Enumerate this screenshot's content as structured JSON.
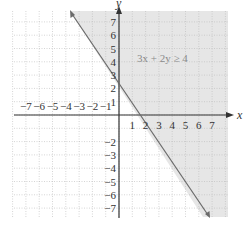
{
  "chart_data": {
    "type": "line",
    "title": "",
    "annotation": "3x + 2y ≥ 4",
    "boundary_line": {
      "equation": "3x + 2y = 4",
      "style": "solid",
      "slope": -1.5,
      "y_intercept": 2,
      "x_intercept": 1.3333
    },
    "shaded_region": "3x + 2y ≥ 4 (above/right of line)",
    "xlabel": "x",
    "ylabel": "y",
    "xlim": [
      -8,
      8
    ],
    "ylim": [
      -8,
      8
    ],
    "x_ticks": [
      -7,
      -6,
      -5,
      -4,
      -3,
      -2,
      -1,
      1,
      2,
      3,
      4,
      5,
      6,
      7
    ],
    "y_ticks": [
      -7,
      -6,
      -5,
      -4,
      -3,
      -2,
      1,
      2,
      3,
      4,
      5,
      6,
      7
    ],
    "grid": true,
    "series": [
      {
        "name": "3x + 2y = 4",
        "x": [
          -3.67,
          6.33
        ],
        "y": [
          7.5,
          -7.5
        ]
      }
    ]
  },
  "colors": {
    "shade": "#e6e6e6",
    "grid": "#b8b8b8",
    "axis": "#333333",
    "line": "#6a6a6a",
    "annotation": "#8a8a8a"
  },
  "labels": {
    "x_axis": "x",
    "y_axis": "y",
    "inequality": "3x + 2y ≥ 4",
    "x_tick_labels": [
      "−7",
      "−6",
      "−5",
      "−4",
      "−3",
      "−2",
      "−1",
      "1",
      "2",
      "3",
      "4",
      "5",
      "6",
      "7"
    ],
    "y_tick_labels_pos": [
      "7",
      "6",
      "5",
      "4",
      "3",
      "2",
      "1"
    ],
    "y_tick_labels_neg": [
      "−2",
      "−3",
      "−4",
      "−5",
      "−6",
      "−7"
    ]
  }
}
